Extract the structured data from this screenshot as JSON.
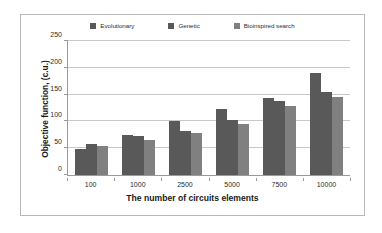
{
  "chart_data": {
    "type": "bar",
    "title": "",
    "xlabel": "The number of circuits elements",
    "ylabel": "Objective function, (c.u.)",
    "categories": [
      "100",
      "1000",
      "2500",
      "5000",
      "7500",
      "10000"
    ],
    "series": [
      {
        "name": "Evolutionary",
        "color": "#595959",
        "values": [
          48,
          75,
          101,
          123,
          144,
          191
        ]
      },
      {
        "name": "Genetic",
        "color": "#595959",
        "values": [
          58,
          72,
          83,
          103,
          138,
          154
        ]
      },
      {
        "name": "Bioinspired search",
        "color": "#808080",
        "values": [
          55,
          66,
          79,
          96,
          128,
          146
        ]
      }
    ],
    "ylim": [
      0,
      250
    ],
    "yticks": [
      0,
      50,
      100,
      150,
      200,
      250
    ],
    "ytick_labels": [
      "0",
      "50",
      "100",
      "150",
      "200",
      "250"
    ],
    "grid": true,
    "legend_position": "top-center",
    "axis_color": "#9a9a9a",
    "grid_color": "#c8c8c8",
    "background": "#ffffff",
    "border_color": "#b9b9b9"
  }
}
